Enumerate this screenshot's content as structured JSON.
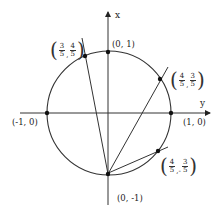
{
  "diagram": {
    "type": "unit-circle",
    "axes": {
      "vertical_label": "x",
      "horizontal_label": "y"
    },
    "points": [
      {
        "id": "top",
        "label": "(0, 1)"
      },
      {
        "id": "bottom",
        "label": "(0, -1)"
      },
      {
        "id": "left",
        "label": "(-1, 0)"
      },
      {
        "id": "right",
        "label": "(1, 0)"
      },
      {
        "id": "q1",
        "num1": "4",
        "den1": "5",
        "sep": ",",
        "num2": "3",
        "den2": "5"
      },
      {
        "id": "q2",
        "num1": "3",
        "den1": "5",
        "sep": ",",
        "num2": "4",
        "den2": "5"
      },
      {
        "id": "q4",
        "num1": "4",
        "den1": "5",
        "sep": ",-",
        "num2": "3",
        "den2": "5"
      }
    ],
    "lines_through": "(0, -1)",
    "colors": {
      "stroke": "#333333",
      "text": "#222222",
      "background": "#ffffff"
    }
  }
}
